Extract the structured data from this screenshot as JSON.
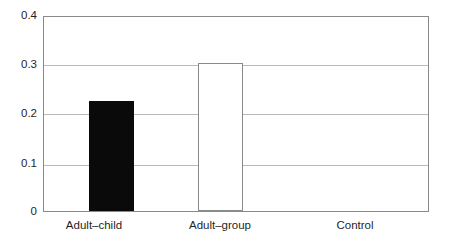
{
  "chart_data": {
    "type": "bar",
    "title": "",
    "subtitle": "",
    "xlabel": "",
    "ylabel": "",
    "categories": [
      "Adult–child",
      "Adult–group",
      "Control"
    ],
    "values": [
      0.227,
      0.306,
      0
    ],
    "series": [
      {
        "name": "proportion",
        "values": [
          0.227,
          0.306,
          0
        ]
      }
    ],
    "bar_styles": [
      "filled-black",
      "hollow-white",
      "none"
    ],
    "ylim": [
      0,
      0.4
    ],
    "yticks": [
      0,
      0.1,
      0.2,
      0.3,
      0.4
    ],
    "ytick_labels": [
      "0",
      "0.1",
      "0.2",
      "0.3",
      "0.4"
    ],
    "grid": true,
    "grid_axis": "y",
    "legend": false,
    "legend_position": "none",
    "annotations": [],
    "colors": {
      "bar_filled": "#0a0a0a",
      "bar_hollow_fill": "#ffffff",
      "bar_hollow_border": "#8a8a8a",
      "gridline": "#b9b9b9",
      "axis": "#8a8a8a",
      "text": "#1f1f1f",
      "background": "#ffffff"
    }
  }
}
